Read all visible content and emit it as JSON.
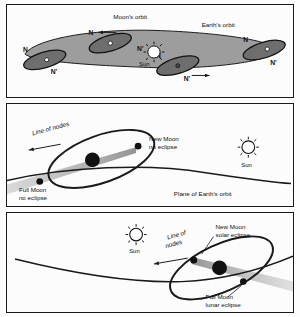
{
  "figure": {
    "panels": [
      {
        "id": "panel-1",
        "name": "orbital-overview",
        "labels": {
          "moons_orbit": "Moon's orbit",
          "earths_orbit": "Earth's orbit",
          "sun": "Sun",
          "node_ascending": "N",
          "node_descending": "N'"
        },
        "positions": [
          {
            "name": "top-left-position",
            "node_n": "N",
            "node_np": "N'"
          },
          {
            "name": "left-position",
            "node_n": "N",
            "node_np": "N'"
          },
          {
            "name": "bottom-center-position",
            "node_n": "N",
            "node_np": "N'"
          },
          {
            "name": "right-position",
            "node_n": "N",
            "node_np": "N'"
          }
        ],
        "arrows": [
          "left-motion-arrow",
          "right-motion-arrow"
        ]
      },
      {
        "id": "panel-2",
        "name": "no-eclipse-configuration",
        "labels": {
          "line_of_nodes": "Line of nodes",
          "new_moon": "New Moon",
          "new_moon_sub": "no eclipse",
          "full_moon": "Full Moon",
          "full_moon_sub": "no eclipse",
          "plane": "Plane of Earth's orbit",
          "sun": "Sun"
        }
      },
      {
        "id": "panel-3",
        "name": "eclipse-configuration",
        "labels": {
          "line_of_nodes_1": "Line of",
          "line_of_nodes_2": "nodes",
          "new_moon": "New Moon",
          "new_moon_sub": "solar eclipse",
          "full_moon": "Full Moon",
          "full_moon_sub": "lunar eclipse",
          "sun": "Sun"
        }
      }
    ],
    "colors": {
      "ink": "#1a1a1a",
      "orbit_band": "#9d9d9d",
      "moon_plane": "#6e6e6e",
      "shadow": "#a8a8a8",
      "earth": "#111111",
      "background": "#fdfdfd"
    }
  }
}
